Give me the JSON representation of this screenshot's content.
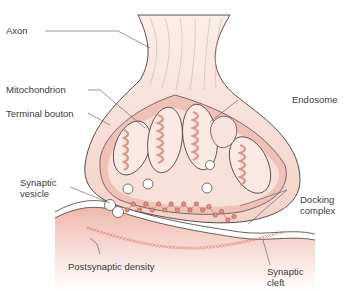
{
  "diagram": {
    "colors": {
      "tissue_light": "#f6d9d2",
      "tissue_mid": "#efc2b7",
      "tissue_dark": "#e3a595",
      "outline": "#4a3a36",
      "vesicle": "#ffffff",
      "density": "#d9786a"
    },
    "labels": {
      "axon": "Axon",
      "mitochondrion": "Mitochondrion",
      "terminal_bouton": "Terminal bouton",
      "endosome": "Endosome",
      "synaptic_vesicle_1": "Synaptic",
      "synaptic_vesicle_2": "vesicle",
      "docking_complex_1": "Docking",
      "docking_complex_2": "complex",
      "postsynaptic_density": "Postsynaptic density",
      "synaptic_cleft_1": "Synaptic",
      "synaptic_cleft_2": "cleft"
    }
  }
}
